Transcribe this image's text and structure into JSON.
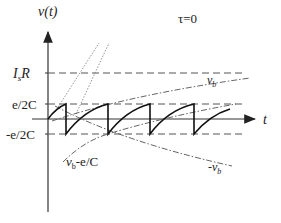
{
  "diagram": {
    "y_axis_label": "v(t)",
    "x_axis_label": "t",
    "condition": "τ=0",
    "levels": [
      {
        "label": "IsR",
        "display_main": "I",
        "display_sub": "s",
        "display_rest": "R"
      },
      {
        "label": "e/2C"
      },
      {
        "label": "-e/2C"
      }
    ],
    "curve_labels": {
      "vb": "v",
      "vb_sub": "b",
      "neg_vb": "-v",
      "neg_vb_sub": "b",
      "vb_minus": "v",
      "vb_minus_sub": "b",
      "vb_minus_rest": "-e/C"
    },
    "colors": {
      "axis": "#333333",
      "sawtooth": "#111111",
      "dashed": "#555555",
      "dashdot": "#666666",
      "dotted": "#888888"
    }
  }
}
